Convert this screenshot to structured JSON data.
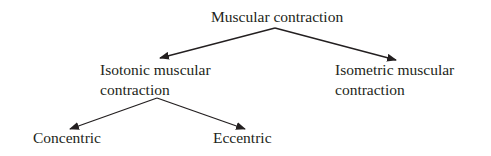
{
  "diagram": {
    "root": {
      "label": "Muscular contraction"
    },
    "left": {
      "line1": "Isotonic muscular",
      "line2": "contraction"
    },
    "right": {
      "line1": "Isometric muscular",
      "line2": "contraction"
    },
    "leaf_left": {
      "label": "Concentric"
    },
    "leaf_right": {
      "label": "Eccentric"
    },
    "colors": {
      "text": "#231f20",
      "arrow": "#231f20"
    }
  }
}
